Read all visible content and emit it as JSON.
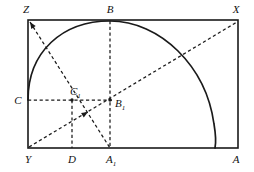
{
  "figure": {
    "canvas": {
      "width": 254,
      "height": 172
    },
    "colors": {
      "stroke": "#1a1a1a",
      "background": "#ffffff",
      "label": "#111111"
    },
    "rectangle": {
      "name": "ZXAY",
      "left": 28,
      "top": 20,
      "right": 238,
      "bottom": 148
    },
    "arc": {
      "description": "curve from C on left edge through B at top to A at bottom-right corner",
      "path": "M 28 100 C 28 52 62 21 110 21 C 160 21 206 66 214 124 C 216 136 216 143 215 148",
      "endpoints": [
        "C",
        "B",
        "A"
      ]
    },
    "points": [
      {
        "id": "Z",
        "label": "Z",
        "sub": "",
        "x": 28,
        "y": 20,
        "label_x": 26,
        "label_y": 13,
        "anchor": "middle",
        "dot": false
      },
      {
        "id": "B",
        "label": "B",
        "sub": "",
        "x": 110,
        "y": 20,
        "label_x": 110,
        "label_y": 13,
        "anchor": "middle",
        "dot": false
      },
      {
        "id": "X",
        "label": "X",
        "sub": "",
        "x": 238,
        "y": 20,
        "label_x": 236,
        "label_y": 13,
        "anchor": "middle",
        "dot": false
      },
      {
        "id": "C",
        "label": "C",
        "sub": "",
        "x": 28,
        "y": 100,
        "label_x": 18,
        "label_y": 104,
        "anchor": "middle",
        "dot": false
      },
      {
        "id": "C1",
        "label": "C",
        "sub": "1",
        "x": 72,
        "y": 100,
        "label_x": 70,
        "label_y": 95,
        "anchor": "start",
        "dot": true
      },
      {
        "id": "B1",
        "label": "B",
        "sub": "1",
        "x": 110,
        "y": 100,
        "label_x": 115,
        "label_y": 107,
        "anchor": "start",
        "dot": true
      },
      {
        "id": "Y",
        "label": "Y",
        "sub": "",
        "x": 28,
        "y": 148,
        "label_x": 28,
        "label_y": 163,
        "anchor": "middle",
        "dot": false
      },
      {
        "id": "D",
        "label": "D",
        "sub": "",
        "x": 72,
        "y": 148,
        "label_x": 72,
        "label_y": 163,
        "anchor": "middle",
        "dot": false
      },
      {
        "id": "A1",
        "label": "A",
        "sub": "1",
        "x": 110,
        "y": 148,
        "label_x": 106,
        "label_y": 163,
        "anchor": "start",
        "dot": false
      },
      {
        "id": "A",
        "label": "A",
        "sub": "",
        "x": 238,
        "y": 148,
        "label_x": 236,
        "label_y": 163,
        "anchor": "middle",
        "dot": false
      }
    ],
    "dashed_segments": [
      {
        "name": "segment-C-to-B1",
        "from": "C",
        "to": "B1",
        "x1": 28,
        "y1": 100,
        "x2": 112,
        "y2": 100
      },
      {
        "name": "segment-B-to-A1",
        "from": "B",
        "to": "A1",
        "x1": 110,
        "y1": 21,
        "x2": 110,
        "y2": 148
      },
      {
        "name": "segment-C1-to-D",
        "from": "C1",
        "to": "D",
        "x1": 72,
        "y1": 100,
        "x2": 72,
        "y2": 148
      },
      {
        "name": "segment-Z-to-A1",
        "from": "Z",
        "to": "A1",
        "x1": 30,
        "y1": 22,
        "x2": 110,
        "y2": 148
      },
      {
        "name": "segment-Y-to-X",
        "from": "Y",
        "to": "X",
        "x1": 29,
        "y1": 147,
        "x2": 237,
        "y2": 22
      }
    ],
    "arrow_markers": [
      {
        "name": "arrow-at-Z",
        "on": "segment-Z-to-A1",
        "x": 30,
        "y": 22,
        "angle": 237.6
      },
      {
        "name": "arrow-midline-YX",
        "on": "segment-Y-to-X",
        "x": 88,
        "y": 112,
        "angle": 329.0
      }
    ]
  }
}
